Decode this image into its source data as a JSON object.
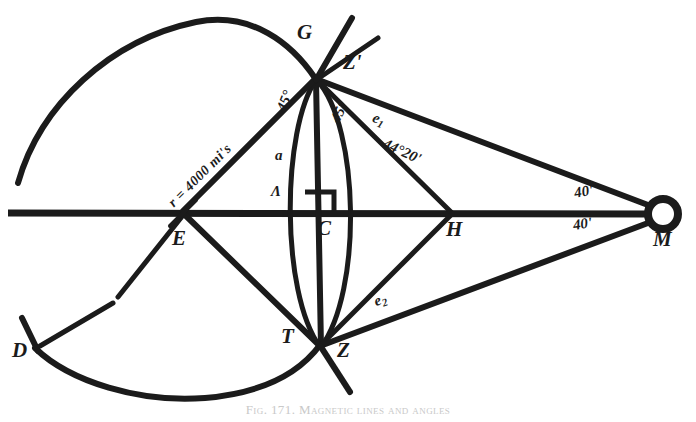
{
  "figure": {
    "caption": "Fig. 171. Magnetic lines and angles",
    "ink_color": "#1b1b1b",
    "background_color": "#ffffff"
  },
  "points": [
    {
      "id": "G",
      "label": "G",
      "x": 315,
      "y": 78,
      "label_x": 297,
      "label_y": 26
    },
    {
      "id": "Zp",
      "label": "Z'",
      "x": 340,
      "y": 60,
      "label_x": 343,
      "label_y": 57
    },
    {
      "id": "E",
      "label": "E",
      "x": 185,
      "y": 212,
      "label_x": 173,
      "label_y": 231
    },
    {
      "id": "C",
      "label": "C",
      "x": 322,
      "y": 213,
      "label_x": 318,
      "label_y": 220
    },
    {
      "id": "H",
      "label": "H",
      "x": 452,
      "y": 213,
      "label_x": 447,
      "label_y": 221
    },
    {
      "id": "M",
      "label": "M",
      "x": 663,
      "y": 214,
      "label_x": 655,
      "label_y": 228
    },
    {
      "id": "T",
      "label": "T",
      "x": 320,
      "y": 345,
      "label_x": 282,
      "label_y": 330
    },
    {
      "id": "Z",
      "label": "Z",
      "x": 333,
      "y": 350,
      "label_x": 337,
      "label_y": 343
    },
    {
      "id": "D",
      "label": "D",
      "x": 35,
      "y": 348,
      "label_x": 14,
      "label_y": 345
    }
  ],
  "annotations": {
    "radius": "r = 4000 mi's",
    "angle_upper_left": "45°",
    "angle_upper_right": "45°",
    "elongation_upper": "e",
    "elongation_upper_sub": "1",
    "elongation_upper_value": "44°20'",
    "elongation_lower": "e",
    "elongation_lower_sub": "2",
    "arc_minutes_upper": "40'",
    "arc_minutes_lower": "40'",
    "side_a": "a",
    "angle_lambda": "Λ"
  },
  "geometry": {
    "axis_y": 213,
    "axis_x_start": 8,
    "axis_x_end": 650,
    "earth_circle": {
      "cx": 222,
      "cy": 212,
      "r": 190
    },
    "lens": {
      "cx": 322,
      "cy": 213,
      "half_width": 45,
      "half_height": 138
    },
    "m_marker": {
      "cx": 663,
      "cy": 214,
      "r": 17
    }
  }
}
